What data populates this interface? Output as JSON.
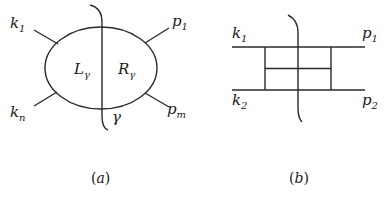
{
  "diagram_a": {
    "caption_open": "(",
    "caption_letter": "a",
    "caption_close": ")",
    "incoming": [
      {
        "base": "k",
        "sub": "1"
      },
      {
        "base": "k",
        "sub": "n"
      }
    ],
    "outgoing": [
      {
        "base": "p",
        "sub": "1"
      },
      {
        "base": "p",
        "sub": "m"
      }
    ],
    "left_region": {
      "base": "L",
      "sub": "γ"
    },
    "right_region": {
      "base": "R",
      "sub": "γ"
    },
    "cut_label": "γ"
  },
  "diagram_b": {
    "caption_open": "(",
    "caption_letter": "b",
    "caption_close": ")",
    "incoming": [
      {
        "base": "k",
        "sub": "1"
      },
      {
        "base": "k",
        "sub": "2"
      }
    ],
    "outgoing": [
      {
        "base": "p",
        "sub": "1"
      },
      {
        "base": "p",
        "sub": "2"
      }
    ]
  },
  "colors": {
    "line": "#2a2a2a",
    "text": "#1a1a1a",
    "background": "#ffffff"
  }
}
